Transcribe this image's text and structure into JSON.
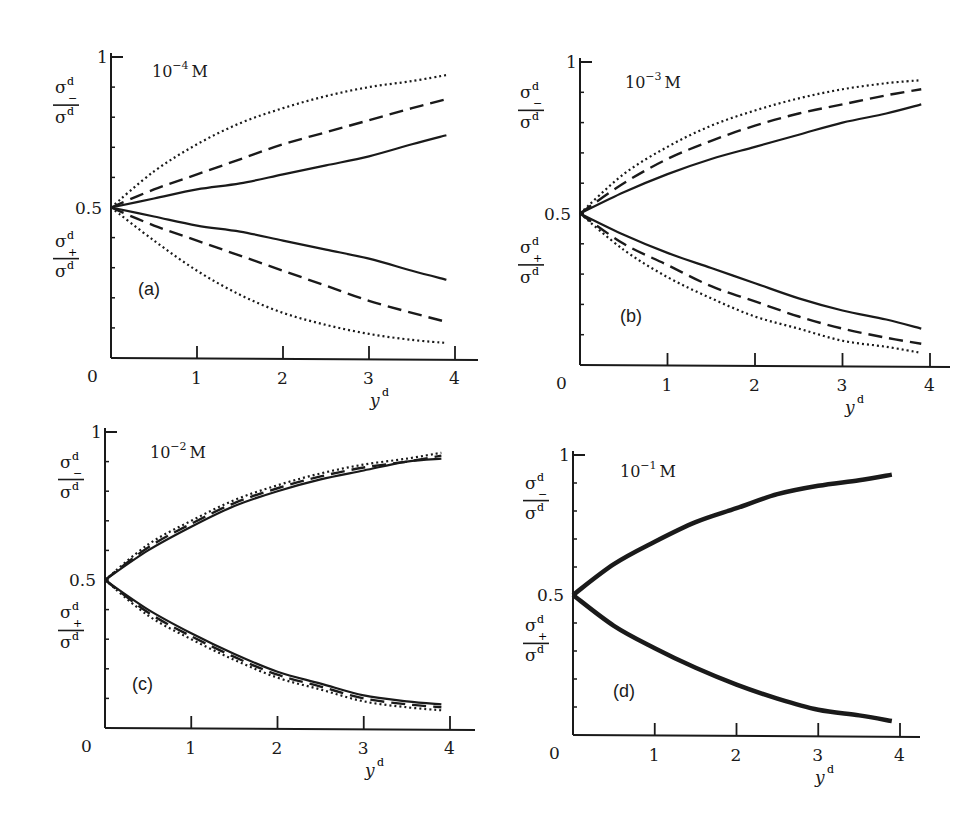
{
  "chart_data": [
    {
      "type": "line",
      "panel": "(a)",
      "title": "10^-4 M",
      "concentration_base": "10",
      "concentration_exp": "−4",
      "concentration_unit": "M",
      "xlabel": "y^d",
      "ylabel_upper": "σ^d_− / σ^d",
      "ylabel_lower": "σ^d_+ / σ^d",
      "xlim": [
        0,
        4
      ],
      "ylim": [
        0,
        1
      ],
      "x_ticks": [
        "0",
        "1",
        "2",
        "3",
        "4"
      ],
      "y_ticks": [
        "0.5",
        "1"
      ],
      "x": [
        0,
        0.5,
        1,
        1.5,
        2,
        2.5,
        3,
        3.5,
        3.9
      ],
      "series": [
        {
          "name": "solid upper",
          "style": "solid",
          "values": [
            0.5,
            0.53,
            0.56,
            0.58,
            0.61,
            0.64,
            0.67,
            0.71,
            0.74
          ]
        },
        {
          "name": "dashed upper",
          "style": "dashed",
          "values": [
            0.5,
            0.56,
            0.61,
            0.66,
            0.71,
            0.75,
            0.79,
            0.83,
            0.86
          ]
        },
        {
          "name": "dotted upper",
          "style": "dotted",
          "values": [
            0.5,
            0.62,
            0.71,
            0.78,
            0.83,
            0.87,
            0.9,
            0.92,
            0.94
          ]
        },
        {
          "name": "solid lower",
          "style": "solid",
          "values": [
            0.5,
            0.47,
            0.44,
            0.42,
            0.39,
            0.36,
            0.33,
            0.29,
            0.26
          ]
        },
        {
          "name": "dashed lower",
          "style": "dashed",
          "values": [
            0.5,
            0.44,
            0.39,
            0.34,
            0.29,
            0.24,
            0.19,
            0.15,
            0.12
          ]
        },
        {
          "name": "dotted lower",
          "style": "dotted",
          "values": [
            0.5,
            0.39,
            0.29,
            0.21,
            0.15,
            0.11,
            0.08,
            0.06,
            0.05
          ]
        }
      ]
    },
    {
      "type": "line",
      "panel": "(b)",
      "title": "10^-3 M",
      "concentration_base": "10",
      "concentration_exp": "−3",
      "concentration_unit": "M",
      "xlabel": "y^d",
      "ylabel_upper": "σ^d_− / σ^d",
      "ylabel_lower": "σ^d_+ / σ^d",
      "xlim": [
        0,
        4
      ],
      "ylim": [
        0,
        1
      ],
      "x_ticks": [
        "0",
        "1",
        "2",
        "3",
        "4"
      ],
      "y_ticks": [
        "0.5",
        "1"
      ],
      "x": [
        0,
        0.5,
        1,
        1.5,
        2,
        2.5,
        3,
        3.5,
        3.9
      ],
      "series": [
        {
          "name": "solid upper",
          "style": "solid",
          "values": [
            0.5,
            0.57,
            0.63,
            0.68,
            0.72,
            0.76,
            0.8,
            0.83,
            0.86
          ]
        },
        {
          "name": "dashed upper",
          "style": "dashed",
          "values": [
            0.5,
            0.6,
            0.68,
            0.74,
            0.79,
            0.83,
            0.86,
            0.89,
            0.91
          ]
        },
        {
          "name": "dotted upper",
          "style": "dotted",
          "values": [
            0.5,
            0.63,
            0.72,
            0.79,
            0.84,
            0.88,
            0.91,
            0.93,
            0.94
          ]
        },
        {
          "name": "solid lower",
          "style": "solid",
          "values": [
            0.5,
            0.43,
            0.37,
            0.32,
            0.27,
            0.22,
            0.18,
            0.15,
            0.12
          ]
        },
        {
          "name": "dashed lower",
          "style": "dashed",
          "values": [
            0.5,
            0.4,
            0.33,
            0.26,
            0.21,
            0.16,
            0.12,
            0.09,
            0.07
          ]
        },
        {
          "name": "dotted lower",
          "style": "dotted",
          "values": [
            0.5,
            0.38,
            0.29,
            0.22,
            0.16,
            0.12,
            0.08,
            0.06,
            0.04
          ]
        }
      ]
    },
    {
      "type": "line",
      "panel": "(c)",
      "title": "10^-2 M",
      "concentration_base": "10",
      "concentration_exp": "−2",
      "concentration_unit": "M",
      "xlabel": "y^d",
      "ylabel_upper": "σ^d_− / σ^d",
      "ylabel_lower": "σ^d_+ / σ^d",
      "xlim": [
        0,
        4
      ],
      "ylim": [
        0,
        1
      ],
      "x_ticks": [
        "0",
        "1",
        "2",
        "3",
        "4"
      ],
      "y_ticks": [
        "0.5",
        "1"
      ],
      "x": [
        0,
        0.5,
        1,
        1.5,
        2,
        2.5,
        3,
        3.5,
        3.9
      ],
      "series": [
        {
          "name": "solid upper",
          "style": "solid",
          "values": [
            0.5,
            0.6,
            0.68,
            0.75,
            0.8,
            0.84,
            0.87,
            0.9,
            0.91
          ]
        },
        {
          "name": "dashed upper",
          "style": "dashed",
          "values": [
            0.5,
            0.61,
            0.69,
            0.76,
            0.81,
            0.85,
            0.88,
            0.9,
            0.92
          ]
        },
        {
          "name": "dotted upper",
          "style": "dotted",
          "values": [
            0.5,
            0.62,
            0.7,
            0.77,
            0.82,
            0.86,
            0.89,
            0.91,
            0.93
          ]
        },
        {
          "name": "solid lower",
          "style": "solid",
          "values": [
            0.5,
            0.4,
            0.32,
            0.25,
            0.19,
            0.15,
            0.11,
            0.09,
            0.08
          ]
        },
        {
          "name": "dashed lower",
          "style": "dashed",
          "values": [
            0.5,
            0.39,
            0.31,
            0.24,
            0.18,
            0.14,
            0.1,
            0.08,
            0.07
          ]
        },
        {
          "name": "dotted lower",
          "style": "dotted",
          "values": [
            0.5,
            0.38,
            0.3,
            0.23,
            0.17,
            0.13,
            0.09,
            0.07,
            0.06
          ]
        }
      ]
    },
    {
      "type": "line",
      "panel": "(d)",
      "title": "10^-1 M",
      "concentration_base": "10",
      "concentration_exp": "−1",
      "concentration_unit": "M",
      "xlabel": "y^d",
      "ylabel_upper": "σ^d_− / σ^d",
      "ylabel_lower": "σ^d_+ / σ^d",
      "xlim": [
        0,
        4
      ],
      "ylim": [
        0,
        1
      ],
      "x_ticks": [
        "0",
        "1",
        "2",
        "3",
        "4"
      ],
      "y_ticks": [
        "0.5",
        "1"
      ],
      "x": [
        0,
        0.5,
        1,
        1.5,
        2,
        2.5,
        3,
        3.5,
        3.9
      ],
      "series": [
        {
          "name": "upper (all curves coincide)",
          "style": "solid",
          "values": [
            0.5,
            0.61,
            0.69,
            0.76,
            0.81,
            0.86,
            0.89,
            0.91,
            0.93
          ]
        },
        {
          "name": "lower (all curves coincide)",
          "style": "solid",
          "values": [
            0.5,
            0.39,
            0.31,
            0.24,
            0.18,
            0.13,
            0.09,
            0.07,
            0.05
          ]
        }
      ]
    }
  ],
  "labels": {
    "sigma": "σ",
    "d": "d",
    "minus": "−",
    "plus": "+",
    "xvar": "y",
    "half": "0.5",
    "one": "1",
    "zero": "0"
  }
}
